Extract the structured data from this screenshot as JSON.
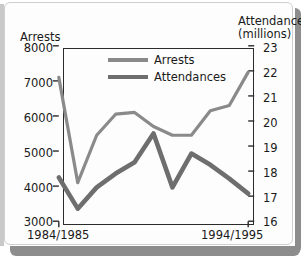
{
  "card": {
    "background_color": "#fdfdfd",
    "border_color": "#cfcfcf",
    "shadow_color": "#8d8d8d"
  },
  "chart_data": {
    "type": "line",
    "title": "",
    "xlabel": "",
    "ylabel": "Arrests",
    "y2label": "Attendances (millions)",
    "grid": false,
    "legend_position": "top-center-inside",
    "x": [
      "1984/1985",
      "1985/1986",
      "1986/1987",
      "1987/1988",
      "1988/1989",
      "1989/1990",
      "1990/1991",
      "1991/1992",
      "1992/1993",
      "1993/1994",
      "1994/1995"
    ],
    "x_tick_labels": [
      "1984/1985",
      "1994/1995"
    ],
    "axes": {
      "left": {
        "label": "Arrests",
        "ticks": [
          3000,
          4000,
          5000,
          6000,
          7000,
          8000
        ],
        "ylim": [
          3000,
          8000
        ]
      },
      "right": {
        "label_line1": "Attendances",
        "label_line2": "(millions)",
        "ticks": [
          16,
          17,
          18,
          19,
          20,
          21,
          22,
          23
        ],
        "ylim": [
          16,
          23
        ]
      }
    },
    "series": [
      {
        "name": "Arrests",
        "axis": "left",
        "color": "#8a8a8a",
        "line_width": 3.2,
        "values": [
          7100,
          4100,
          5450,
          6050,
          6100,
          5700,
          5450,
          5450,
          6150,
          6300,
          7250
        ]
      },
      {
        "name": "Attendances",
        "axis": "right",
        "color": "#6e6e6e",
        "line_width": 4.6,
        "values": [
          17.75,
          16.5,
          17.35,
          17.9,
          18.35,
          19.5,
          17.35,
          18.7,
          18.25,
          17.7,
          17.1
        ]
      }
    ],
    "legend": [
      {
        "label": "Arrests",
        "color": "#8a8a8a"
      },
      {
        "label": "Attendances",
        "color": "#6e6e6e"
      }
    ]
  }
}
